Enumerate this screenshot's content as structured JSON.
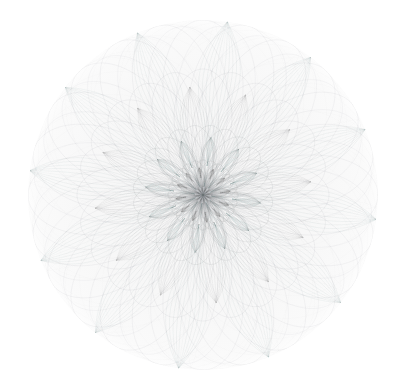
{
  "figure": {
    "title": "",
    "background_color": "#ffffff",
    "width": 409,
    "height": 391
  },
  "disk": {
    "center_x": 203,
    "center_y": 195,
    "radius": 175,
    "fill_color": "#f8f8f8",
    "edge_color": "#f2f2f2"
  },
  "caption": "",
  "chart_data": {
    "type": "line",
    "title": "",
    "subtitle": "",
    "xlabel": "",
    "ylabel": "",
    "grid": false,
    "legend": "none",
    "axes_visible": false,
    "polar": true,
    "xlim": [
      -1,
      1
    ],
    "ylim": [
      -1,
      1
    ],
    "line_color": "#8f9499",
    "line_width": 0.38,
    "line_opacity": 0.2,
    "series": [
      {
        "name": "outer-rose",
        "petals": 12,
        "k_numerator": 12,
        "k_denominator": 5,
        "amplitude": 1.0,
        "phase_deg": 0,
        "turns": 5,
        "samples": 3000,
        "decay": 0.0,
        "opacity": 0.22,
        "width": 0.38,
        "color": "#8d9298"
      },
      {
        "name": "outer-rose-offset",
        "petals": 12,
        "k_numerator": 12,
        "k_denominator": 5,
        "amplitude": 0.97,
        "phase_deg": 7,
        "turns": 5,
        "samples": 3000,
        "decay": 0.0,
        "opacity": 0.18,
        "width": 0.36,
        "color": "#8d9298"
      },
      {
        "name": "mid-rose",
        "petals": 12,
        "k_numerator": 12,
        "k_denominator": 5,
        "amplitude": 0.72,
        "phase_deg": 15,
        "turns": 5,
        "samples": 2600,
        "decay": 0.0,
        "opacity": 0.24,
        "width": 0.36,
        "color": "#858a90"
      },
      {
        "name": "inner-rose",
        "petals": 12,
        "k_numerator": 12,
        "k_denominator": 5,
        "amplitude": 0.4,
        "phase_deg": 22,
        "turns": 5,
        "samples": 2400,
        "decay": 0.0,
        "opacity": 0.3,
        "width": 0.36,
        "color": "#7c8188"
      },
      {
        "name": "core-rose",
        "petals": 12,
        "k_numerator": 12,
        "k_denominator": 5,
        "amplitude": 0.2,
        "phase_deg": 30,
        "turns": 5,
        "samples": 1800,
        "decay": 0.0,
        "opacity": 0.34,
        "width": 0.34,
        "color": "#75797f"
      },
      {
        "name": "halo-web",
        "petals": 12,
        "k_numerator": 12,
        "k_denominator": 7,
        "amplitude": 1.0,
        "phase_deg": 0,
        "turns": 7,
        "samples": 3400,
        "decay": 0.0,
        "opacity": 0.085,
        "width": 0.3,
        "color": "#9aa0a6"
      },
      {
        "name": "halo-web-2",
        "petals": 12,
        "k_numerator": 12,
        "k_denominator": 11,
        "amplitude": 1.0,
        "phase_deg": 12,
        "turns": 11,
        "samples": 3800,
        "decay": 0.0,
        "opacity": 0.07,
        "width": 0.3,
        "color": "#9aa0a6"
      }
    ],
    "petal_bands": {
      "count": 12,
      "rings": [
        {
          "name": "outer-petal-ring",
          "r_inner": 0.17,
          "r_outer": 1.0,
          "half_width_deg": 10.5,
          "phase_deg": 8,
          "strands": 11,
          "opacity": 0.095,
          "width": 0.45,
          "color": "#8a9096"
        },
        {
          "name": "middle-petal-ring",
          "r_inner": 0.1,
          "r_outer": 0.62,
          "half_width_deg": 11.5,
          "phase_deg": 23,
          "strands": 10,
          "opacity": 0.11,
          "width": 0.42,
          "color": "#83888f"
        },
        {
          "name": "inner-petal-ring",
          "r_inner": 0.05,
          "r_outer": 0.33,
          "half_width_deg": 12.5,
          "phase_deg": 38,
          "strands": 9,
          "opacity": 0.15,
          "width": 0.4,
          "color": "#7b8087"
        },
        {
          "name": "core-petal-ring",
          "r_inner": 0.02,
          "r_outer": 0.155,
          "half_width_deg": 13.5,
          "phase_deg": 52,
          "strands": 8,
          "opacity": 0.2,
          "width": 0.38,
          "color": "#73787f"
        }
      ]
    },
    "chords": {
      "name": "background-chord-web",
      "vertices": 12,
      "skips": [
        5,
        7
      ],
      "phase_deg": 4,
      "radius": 0.99,
      "opacity": 0.055,
      "width": 0.3,
      "color": "#a2a7ad"
    }
  }
}
